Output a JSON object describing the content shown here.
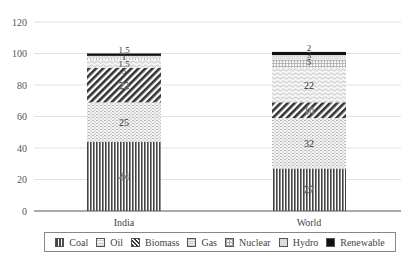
{
  "chart_data": {
    "type": "bar",
    "stacked": true,
    "title": "",
    "xlabel": "",
    "ylabel": "",
    "ylim": [
      0,
      120
    ],
    "yticks": [
      0,
      20,
      40,
      60,
      80,
      100,
      120
    ],
    "grid": true,
    "legend_position": "bottom",
    "categories": [
      "India",
      "World"
    ],
    "series": [
      {
        "name": "Coal",
        "values": [
          44,
          27
        ],
        "pattern": "vertical-lines",
        "color": "#555555"
      },
      {
        "name": "Oil",
        "values": [
          25,
          32
        ],
        "pattern": "light-dots",
        "color": "#bbbbbb"
      },
      {
        "name": "Biomass",
        "values": [
          22,
          10
        ],
        "pattern": "diagonal",
        "color": "#444444"
      },
      {
        "name": "Gas",
        "values": [
          5,
          22
        ],
        "pattern": "waves",
        "color": "#cccccc"
      },
      {
        "name": "Nuclear",
        "values": [
          1.5,
          5
        ],
        "pattern": "grid",
        "color": "#aaaaaa"
      },
      {
        "name": "Hydro",
        "values": [
          1,
          3
        ],
        "pattern": "light",
        "color": "#dddddd"
      },
      {
        "name": "Renewable",
        "values": [
          1.5,
          2
        ],
        "pattern": "solid",
        "color": "#111111"
      }
    ],
    "data_labels": {
      "India": [
        "44",
        "25",
        "22",
        "5",
        "1.5",
        "1",
        "1.5"
      ],
      "World": [
        "27",
        "32",
        "10",
        "22",
        "5",
        "3",
        "2"
      ]
    }
  },
  "axis": {
    "y_tick_labels": [
      "0",
      "20",
      "40",
      "60",
      "80",
      "100",
      "120"
    ],
    "x_tick_labels": [
      "India",
      "World"
    ]
  },
  "legend": {
    "items": [
      {
        "label": "Coal"
      },
      {
        "label": "Oil"
      },
      {
        "label": "Biomass"
      },
      {
        "label": "Gas"
      },
      {
        "label": "Nuclear"
      },
      {
        "label": "Hydro"
      },
      {
        "label": "Renewable"
      }
    ]
  }
}
